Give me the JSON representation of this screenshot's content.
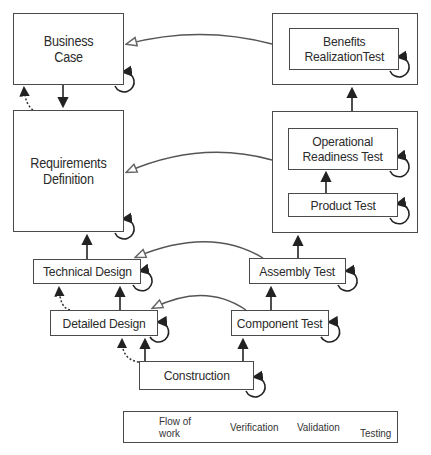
{
  "diagram": {
    "type": "V-model lifecycle",
    "nodes": {
      "business_case": {
        "line1": "Business",
        "line2": "Case"
      },
      "requirements": {
        "line1": "Requirements",
        "line2": "Definition"
      },
      "technical_design": {
        "label": "Technical Design"
      },
      "detailed_design": {
        "label": "Detailed Design"
      },
      "construction": {
        "label": "Construction"
      },
      "component_test": {
        "label": "Component Test"
      },
      "assembly_test": {
        "label": "Assembly Test"
      },
      "product_test": {
        "label": "Product Test"
      },
      "operational_readiness": {
        "line1": "Operational",
        "line2": "Readiness Test"
      },
      "benefits_realization": {
        "line1": "Benefits",
        "line2": "RealizationTest"
      }
    },
    "legend": {
      "flow_of_work_line1": "Flow of",
      "flow_of_work_line2": "work",
      "verification": "Verification",
      "validation": "Validation",
      "testing": "Testing"
    },
    "colors": {
      "stroke": "#2a2a2a",
      "box_border": "#4a4a4a",
      "testing_arrow": "#555555"
    }
  }
}
